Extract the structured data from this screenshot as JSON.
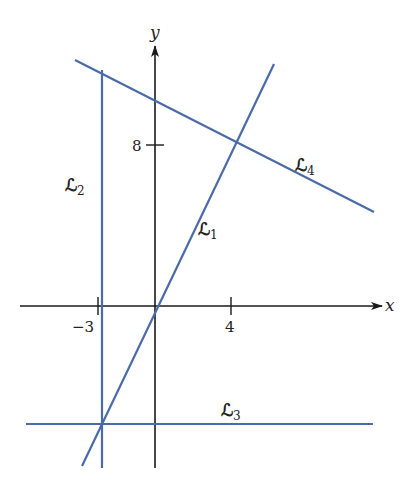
{
  "axes": {
    "x_label": "x",
    "y_label": "y",
    "x_ticks": [
      {
        "value": -3,
        "label": "−3"
      },
      {
        "value": 4,
        "label": "4"
      }
    ],
    "y_ticks": [
      {
        "value": 8,
        "label": "8"
      }
    ]
  },
  "lines": [
    {
      "id": "L1",
      "name": "ℒ",
      "subscript": "1",
      "description": "line through origin with positive slope"
    },
    {
      "id": "L2",
      "name": "ℒ",
      "subscript": "2",
      "description": "vertical line x = -3"
    },
    {
      "id": "L3",
      "name": "ℒ",
      "subscript": "3",
      "description": "horizontal line below x-axis"
    },
    {
      "id": "L4",
      "name": "ℒ",
      "subscript": "4",
      "description": "line with negative slope through (4, 8)"
    }
  ],
  "colors": {
    "line": "#4a6aa8",
    "axis": "#1a1a1a"
  }
}
